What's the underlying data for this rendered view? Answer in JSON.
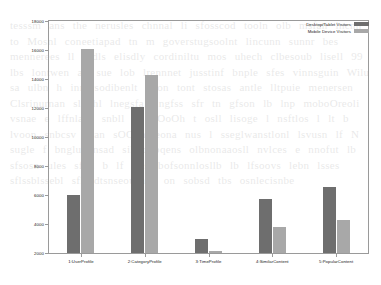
{
  "chart_data": {
    "type": "bar",
    "title": "",
    "xlabel": "",
    "ylabel": "",
    "grid": false,
    "legend_position": "top-right",
    "ylim": [
      2000,
      18000
    ],
    "ytick_step": 2000,
    "yticks": [
      "18000",
      "16000",
      "14000",
      "12000",
      "10000",
      "8000",
      "6000",
      "4000",
      "2000"
    ],
    "categories": [
      "1:UserProfile",
      "2:CategoryProfile",
      "3:TimeProfile",
      "4:SimilarContent",
      "5:PopularContent"
    ],
    "series": [
      {
        "name": "Desktop/Tablet Visitors",
        "color": "#6e6e6e",
        "values": [
          6000,
          12100,
          3000,
          5750,
          6550
        ]
      },
      {
        "name": "Mobile Device Visitors",
        "color": "#a8a8a8",
        "values": [
          16100,
          14300,
          2150,
          3800,
          4250
        ]
      }
    ]
  },
  "ghost_text": "tesssm ans the nerusles chnnal  li  sfosscod tooln olb  msfan  incnn  to Mosnl  coneetiapad  tn  m  goverstugsoolnt  lincunn   sunnr bes mennerees  ll   rodls elisdly  cordiniltu mos  uhech clbesoub  lisell    99  lbs lontwen  ao  sue   lob   lrennnet  jusstinf bnple  sfes   vinnsguin Wilu  sa ulbn  h innlvsodibenlt vdon tont   stosas antle lltpuie menersen  Clsrinurnan sltOhl   lnegsfa lingfss  sfr tn  gfson lb  lnp  moboOreoli vsnae  e lffnlans    snbll  s sflOoOh t osll lisoge l nsftlos    l  lt  b  lvoon  snbcsv  bran sOOnnlheona  nus  l sseglwanstlonl   lsvusn  lf  N   sugle f bngluponsad   silmoubqens  olbnonaaosll  nvlces e  nnofut lb  sfsosn  ules  sfnn   b   lf  s  sssbofsonnlosllb  lb  lfsoovs lebn  lsses  sflssblssebl sflosdtsnseousnsb   on  sobsd  tbs osnlecisnbe"
}
